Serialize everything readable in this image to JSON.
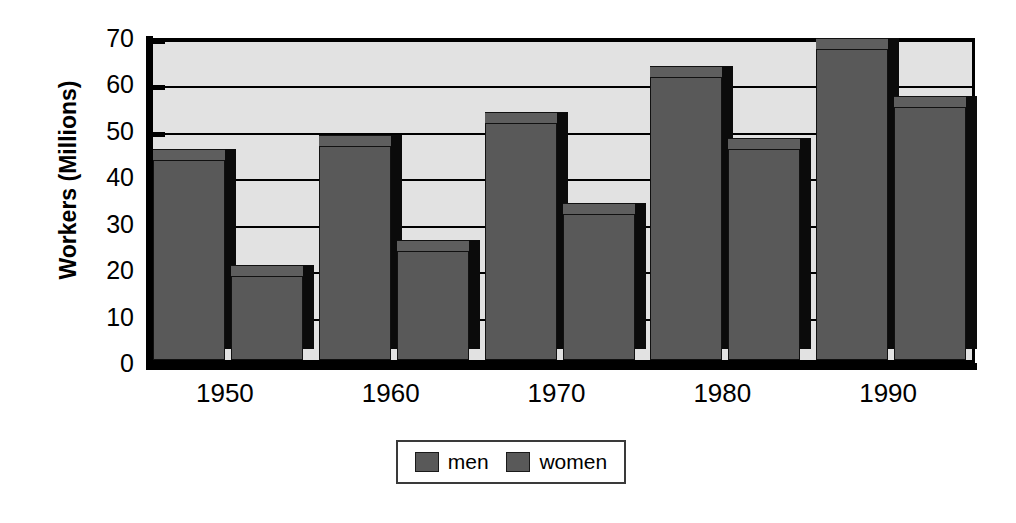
{
  "chart_data": {
    "type": "bar",
    "title": "",
    "subtitle": "",
    "xlabel": "",
    "ylabel": "Workers (Millions)",
    "categories": [
      "1950",
      "1960",
      "1970",
      "1980",
      "1990"
    ],
    "series": [
      {
        "name": "men",
        "values": [
          43,
          46,
          51,
          61,
          67
        ]
      },
      {
        "name": "women",
        "values": [
          18,
          23.5,
          31.5,
          45.5,
          54.5
        ]
      }
    ],
    "ylim": [
      0,
      70
    ],
    "ytick_values": [
      0,
      10,
      20,
      30,
      40,
      50,
      60,
      70
    ],
    "ytick_labels": [
      "0",
      "10",
      "20",
      "30",
      "40",
      "50",
      "60",
      "70"
    ],
    "grid": true,
    "grid_axis": "y",
    "legend_position": "bottom",
    "legend_entries": [
      "men",
      "women"
    ],
    "bar_style": "3d",
    "colors": {
      "bar_face": "#595959",
      "bar_shadow": "#0b0b0b",
      "plot_background": "#e2e2e2",
      "axis": "#000000",
      "page_background": "#ffffff"
    }
  }
}
